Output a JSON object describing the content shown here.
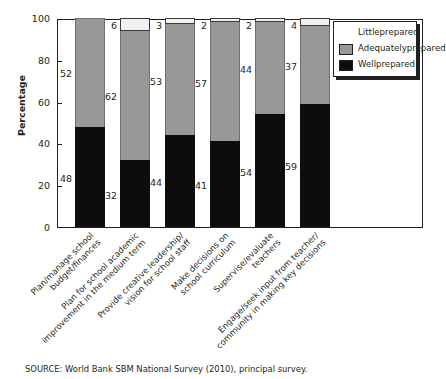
{
  "axis": {
    "y_title": "Percentage",
    "y_ticks": [
      "0",
      "20",
      "40",
      "60",
      "80",
      "100"
    ]
  },
  "legend": {
    "items": [
      {
        "label": "Little\nprepared",
        "line1": "Little",
        "line2": "prepared",
        "color": "#ffffff",
        "key": "little"
      },
      {
        "label": "Adequately\nprepared",
        "line1": "Adequately",
        "line2": "prepared",
        "color": "#989898",
        "key": "adequately"
      },
      {
        "label": "Well\nprepared",
        "line1": "Well",
        "line2": "prepared",
        "color": "#0d0d0d",
        "key": "well"
      }
    ]
  },
  "categories": [
    {
      "line1": "Plan/manage school",
      "line2": "budget/finances"
    },
    {
      "line1": "Plan for school academic",
      "line2": "improvement in the medium term"
    },
    {
      "line1": "Provide creative leadership/",
      "line2": "vision for school staff"
    },
    {
      "line1": "Make decisions on",
      "line2": "school curriculum"
    },
    {
      "line1": "Supervise/evaluate",
      "line2": "teachers"
    },
    {
      "line1": "Engage/seek input from teacher/",
      "line2": "community in making key decisions"
    }
  ],
  "source": "SOURCE: World Bank SBM National Survey (2010), principal survey.",
  "chart_data": {
    "type": "bar",
    "stacked": true,
    "title": "",
    "xlabel": "",
    "ylabel": "Percentage",
    "ylim": [
      0,
      100
    ],
    "yticks": [
      0,
      20,
      40,
      60,
      80,
      100
    ],
    "grid": false,
    "legend_position": "top-right",
    "categories": [
      "Plan/manage school budget/finances",
      "Plan for school academic improvement in the medium term",
      "Provide creative leadership/vision for school staff",
      "Make decisions on school curriculum",
      "Supervise/evaluate teachers",
      "Engage/seek input from teacher/community in making key decisions"
    ],
    "series": [
      {
        "name": "Well prepared",
        "color": "#0d0d0d",
        "values": [
          48,
          32,
          44,
          41,
          54,
          59
        ]
      },
      {
        "name": "Adequately prepared",
        "color": "#989898",
        "values": [
          52,
          62,
          53,
          57,
          44,
          37
        ]
      },
      {
        "name": "Little prepared",
        "color": "#ffffff",
        "values": [
          0,
          6,
          3,
          2,
          2,
          4
        ]
      }
    ],
    "value_labels": {
      "well": [
        "48",
        "32",
        "44",
        "41",
        "54",
        "59"
      ],
      "adequately": [
        "52",
        "62",
        "53",
        "57",
        "44",
        "37"
      ],
      "little": [
        "",
        "6",
        "3",
        "2",
        "2",
        "4"
      ]
    }
  }
}
